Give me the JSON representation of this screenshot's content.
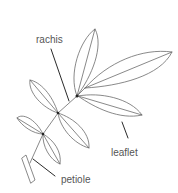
{
  "diagram": {
    "labels": {
      "rachis": "rachis",
      "leaflet": "leaflet",
      "petiole": "petiole"
    },
    "colors": {
      "line": "#6b6b6b",
      "leader": "#2a2a2a",
      "text": "#555555",
      "background": "#ffffff"
    }
  }
}
